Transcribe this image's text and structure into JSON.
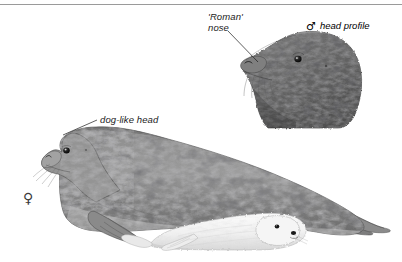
{
  "plate": {
    "width": 402,
    "height": 262,
    "background_color": "#ffffff",
    "subject": "grey seal",
    "style": "pencil-and-wash natural history illustration"
  },
  "divider": {
    "name": "top-rule",
    "color": "#9a9a9a"
  },
  "annotations": {
    "roman_nose": {
      "line1": "'Roman'",
      "line2": "nose"
    },
    "head_profile": {
      "symbol": "♂",
      "text": "head profile"
    },
    "dog_like_head": {
      "text": "dog-like head"
    }
  },
  "symbols": {
    "female": "♀",
    "male": "♂"
  },
  "figures": {
    "male_head": {
      "caption": "male head profile inset",
      "coat_color": "#6f6f6f",
      "spot_color": "#3a3a3a"
    },
    "female_adult": {
      "caption": "adult female grey seal",
      "coat_color": "#8a8a8a",
      "spot_color": "#3f3f3f"
    },
    "pup": {
      "caption": "white-coated grey seal pup",
      "coat_color": "#f2f2f2",
      "shade_color": "#c9c9c9"
    }
  },
  "palette": {
    "ink": "#1b1b1b",
    "rule": "#9a9a9a",
    "paper": "#ffffff",
    "mid_grey": "#8a8a8a",
    "dark_grey": "#3a3a3a",
    "pup_white": "#f4f4f4"
  }
}
